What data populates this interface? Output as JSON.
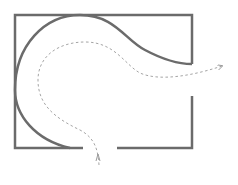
{
  "diagram": {
    "colors": {
      "wall": "#6b6b6b",
      "curve": "#6b6b6b",
      "path": "#9a9a9a",
      "background": "#ffffff"
    },
    "room": {
      "left": 15,
      "top": 15,
      "right": 192,
      "bottom": 148,
      "right_gap": [
        64,
        96
      ],
      "bottom_gap": [
        83,
        117
      ]
    },
    "elements": [
      {
        "name": "room-wall",
        "type": "polyline"
      },
      {
        "name": "curved-wall",
        "type": "curve"
      },
      {
        "name": "dashed-path",
        "type": "arrowed-path",
        "start": "bottom-entry",
        "end": "right-exit"
      }
    ]
  }
}
